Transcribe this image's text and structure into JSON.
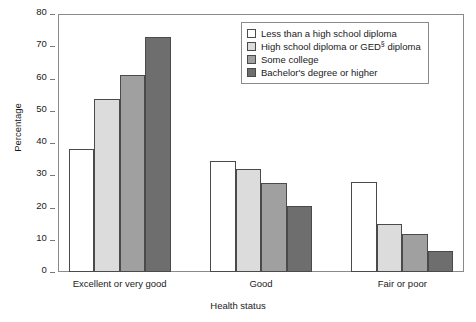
{
  "chart_data": {
    "type": "bar",
    "title": "",
    "subtitle": "",
    "xlabel": "Health status",
    "ylabel": "Percentage",
    "ylim": [
      0,
      80
    ],
    "yticks": [
      0,
      10,
      20,
      30,
      40,
      50,
      60,
      70,
      80
    ],
    "ytick_labels": [
      "0",
      "10",
      "20",
      "30",
      "40",
      "50",
      "60",
      "70",
      "80"
    ],
    "grid": false,
    "legend_position": "top-right",
    "categories": [
      "Excellent or very good",
      "Good",
      "Fair or poor"
    ],
    "series": [
      {
        "name": "Less than a high school diploma",
        "legend_label": "Less than a high school diploma",
        "color": "#ffffff",
        "values": [
          38.0,
          34.5,
          28.0
        ]
      },
      {
        "name": "High school diploma or GED diploma",
        "legend_label": "High school diploma or GED",
        "legend_label_sup": "§",
        "legend_label_tail": " diploma",
        "color": "#dcdcdc",
        "values": [
          53.5,
          32.0,
          15.0
        ]
      },
      {
        "name": "Some college",
        "legend_label": "Some college",
        "color": "#a0a0a0",
        "values": [
          61.0,
          27.5,
          11.7
        ]
      },
      {
        "name": "Bachelor's degree or higher",
        "legend_label": "Bachelor's degree or higher",
        "color": "#6e6e6e",
        "values": [
          73.0,
          20.5,
          6.5
        ]
      }
    ],
    "bar_edge_color": "#4a4a4a",
    "frame_color": "#8a8a8a"
  }
}
